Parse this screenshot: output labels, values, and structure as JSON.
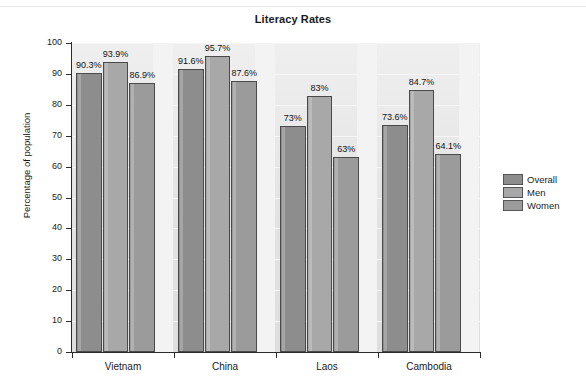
{
  "chart_data": {
    "type": "bar",
    "title": "Literacy Rates",
    "xlabel": "",
    "ylabel": "Percentage of population",
    "ylim": [
      0,
      100
    ],
    "ytick_values": [
      0,
      10,
      20,
      30,
      40,
      50,
      60,
      70,
      80,
      90,
      100
    ],
    "ytick_labels": [
      "0",
      "10",
      "20",
      "30",
      "40",
      "50",
      "60",
      "70",
      "80",
      "90",
      "100"
    ],
    "grid": true,
    "legend_position": "right",
    "categories": [
      "Vietnam",
      "China",
      "Laos",
      "Cambodia"
    ],
    "series": [
      {
        "name": "Overall",
        "color": "#8d8d8d",
        "values": [
          90.3,
          91.6,
          73,
          73.6
        ],
        "data_labels": [
          "90.3%",
          "91.6%",
          "73%",
          "73.6%"
        ]
      },
      {
        "name": "Men",
        "color": "#a8a8a8",
        "values": [
          93.9,
          95.7,
          83,
          84.7
        ],
        "data_labels": [
          "93.9%",
          "95.7%",
          "83%",
          "84.7%"
        ]
      },
      {
        "name": "Women",
        "color": "#9b9b9b",
        "values": [
          86.9,
          87.6,
          63,
          64.1
        ],
        "data_labels": [
          "86.9%",
          "87.6%",
          "63%",
          "64.1%"
        ]
      }
    ]
  },
  "legend": {
    "items": [
      {
        "label": "Overall"
      },
      {
        "label": "Men"
      },
      {
        "label": "Women"
      }
    ]
  }
}
